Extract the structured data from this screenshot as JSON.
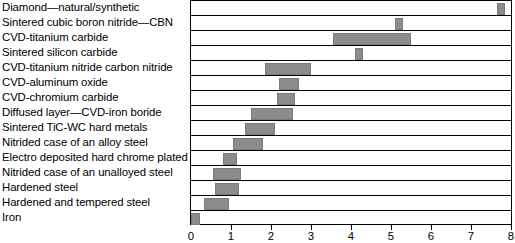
{
  "chart_data": {
    "type": "bar",
    "orientation": "horizontal",
    "title": "",
    "xlabel": "",
    "ylabel": "",
    "xlim": [
      0,
      8
    ],
    "xticks": [
      0,
      1,
      2,
      3,
      4,
      5,
      6,
      7,
      8
    ],
    "xtick_labels": [
      "0",
      "1",
      "2",
      "3",
      "4",
      "5",
      "6",
      "7",
      "8"
    ],
    "grid": true,
    "legend": "none",
    "bar_color": "#8c8c8c",
    "frame_color": "#000000",
    "categories": [
      "Diamond—natural/synthetic",
      "Sintered cubic boron nitride—CBN",
      "CVD-titanium carbide",
      "Sintered silicon carbide",
      "CVD-titanium nitride carbon nitride",
      "CVD-aluminum oxide",
      "CVD-chromium carbide",
      "Diffused layer—CVD-iron boride",
      "Sintered TiC-WC hard metals",
      "Nitrided case of an alloy steel",
      "Electro deposited hard chrome plated",
      "Nitrided case of an unalloyed steel",
      "Hardened steel",
      "Hardened and tempered steel",
      "Iron"
    ],
    "ranges": [
      {
        "label": "Diamond—natural/synthetic",
        "start": 7.65,
        "end": 7.85
      },
      {
        "label": "Sintered cubic boron nitride—CBN",
        "start": 5.1,
        "end": 5.3
      },
      {
        "label": "CVD-titanium carbide",
        "start": 3.55,
        "end": 5.5
      },
      {
        "label": "Sintered silicon carbide",
        "start": 4.1,
        "end": 4.3
      },
      {
        "label": "CVD-titanium nitride carbon nitride",
        "start": 1.85,
        "end": 3.0
      },
      {
        "label": "CVD-aluminum oxide",
        "start": 2.2,
        "end": 2.7
      },
      {
        "label": "CVD-chromium carbide",
        "start": 2.15,
        "end": 2.6
      },
      {
        "label": "Diffused layer—CVD-iron boride",
        "start": 1.5,
        "end": 2.55
      },
      {
        "label": "Sintered TiC-WC hard metals",
        "start": 1.35,
        "end": 2.1
      },
      {
        "label": "Nitrided case of an alloy steel",
        "start": 1.05,
        "end": 1.8
      },
      {
        "label": "Electro deposited hard chrome plated",
        "start": 0.8,
        "end": 1.15
      },
      {
        "label": "Nitrided case of an unalloyed steel",
        "start": 0.55,
        "end": 1.25
      },
      {
        "label": "Hardened steel",
        "start": 0.6,
        "end": 1.2
      },
      {
        "label": "Hardened and tempered steel",
        "start": 0.32,
        "end": 0.95
      },
      {
        "label": "Iron",
        "start": 0.0,
        "end": 0.22
      }
    ]
  }
}
